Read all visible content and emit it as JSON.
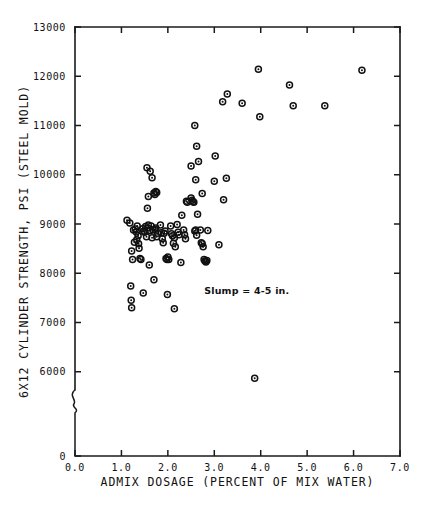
{
  "chart_data": {
    "type": "scatter",
    "title": "",
    "xlabel": "ADMIX DOSAGE (PERCENT OF MIX WATER)",
    "ylabel": "6X12 CYLINDER STRENGTH, PSI (STEEL MOLD)",
    "xlim": [
      0.0,
      7.0
    ],
    "ylim": [
      5500,
      13000
    ],
    "y_axis_break": true,
    "y_axis_break_note": "axis broken between 0 and 6000",
    "grid": false,
    "legend": "none",
    "xticks": [
      "0.0",
      "1.0",
      "2.0",
      "3.0",
      "4.0",
      "5.0",
      "6.0",
      "7.0"
    ],
    "xtick_values": [
      0.0,
      1.0,
      2.0,
      3.0,
      4.0,
      5.0,
      6.0,
      7.0
    ],
    "yticks": [
      "0",
      "6000",
      "7000",
      "8000",
      "9000",
      "10000",
      "11000",
      "12000",
      "13000"
    ],
    "ytick_values": [
      0,
      6000,
      7000,
      8000,
      9000,
      10000,
      11000,
      12000,
      13000
    ],
    "annotations": [
      {
        "name": "slump-annotation",
        "text": "Slump = 4-5 in.",
        "x": 3.7,
        "y": 7580
      }
    ],
    "marker_style": "open-circle-with-dot",
    "series": [
      {
        "name": "6x12 cylinder strength",
        "points": [
          [
            1.12,
            9075
          ],
          [
            1.18,
            9020
          ],
          [
            1.22,
            8450
          ],
          [
            1.24,
            8280
          ],
          [
            1.26,
            8880
          ],
          [
            1.28,
            8630
          ],
          [
            1.2,
            7740
          ],
          [
            1.21,
            7450
          ],
          [
            1.22,
            7300
          ],
          [
            1.34,
            8960
          ],
          [
            1.36,
            8760
          ],
          [
            1.37,
            8600
          ],
          [
            1.38,
            8510
          ],
          [
            1.4,
            8300
          ],
          [
            1.42,
            8280
          ],
          [
            1.3,
            8900
          ],
          [
            1.32,
            8840
          ],
          [
            1.33,
            8680
          ],
          [
            1.46,
            8905
          ],
          [
            1.48,
            8860
          ],
          [
            1.5,
            8830
          ],
          [
            1.52,
            8950
          ],
          [
            1.54,
            8740
          ],
          [
            1.56,
            8920
          ],
          [
            1.58,
            8980
          ],
          [
            1.47,
            7600
          ],
          [
            1.62,
            8870
          ],
          [
            1.64,
            8960
          ],
          [
            1.66,
            8720
          ],
          [
            1.68,
            8880
          ],
          [
            1.6,
            8170
          ],
          [
            1.72,
            8890
          ],
          [
            1.74,
            8920
          ],
          [
            1.76,
            8740
          ],
          [
            1.78,
            8810
          ],
          [
            1.7,
            7870
          ],
          [
            1.55,
            10140
          ],
          [
            1.62,
            10070
          ],
          [
            1.66,
            9940
          ],
          [
            1.58,
            9560
          ],
          [
            1.56,
            9320
          ],
          [
            1.7,
            9630
          ],
          [
            1.72,
            9600
          ],
          [
            1.74,
            9660
          ],
          [
            1.76,
            9640
          ],
          [
            1.84,
            8980
          ],
          [
            1.86,
            8820
          ],
          [
            1.88,
            8700
          ],
          [
            1.9,
            8620
          ],
          [
            1.92,
            8810
          ],
          [
            1.94,
            8860
          ],
          [
            1.96,
            8300
          ],
          [
            1.98,
            8280
          ],
          [
            2.0,
            8330
          ],
          [
            2.02,
            8280
          ],
          [
            1.99,
            7570
          ],
          [
            2.06,
            8960
          ],
          [
            2.08,
            8800
          ],
          [
            2.1,
            8760
          ],
          [
            2.12,
            8610
          ],
          [
            2.14,
            8720
          ],
          [
            2.16,
            8540
          ],
          [
            2.14,
            7280
          ],
          [
            2.2,
            8990
          ],
          [
            2.22,
            8830
          ],
          [
            2.24,
            8780
          ],
          [
            2.28,
            8220
          ],
          [
            2.34,
            8880
          ],
          [
            2.36,
            8780
          ],
          [
            2.38,
            8700
          ],
          [
            2.4,
            9460
          ],
          [
            2.42,
            9440
          ],
          [
            2.3,
            9180
          ],
          [
            2.5,
            9530
          ],
          [
            2.52,
            9480
          ],
          [
            2.54,
            9450
          ],
          [
            2.56,
            9440
          ],
          [
            2.58,
            8860
          ],
          [
            2.6,
            8880
          ],
          [
            2.62,
            8770
          ],
          [
            2.64,
            9200
          ],
          [
            2.7,
            8880
          ],
          [
            2.72,
            8620
          ],
          [
            2.74,
            8600
          ],
          [
            2.76,
            8540
          ],
          [
            2.78,
            8280
          ],
          [
            2.8,
            8250
          ],
          [
            2.82,
            8230
          ],
          [
            2.84,
            8260
          ],
          [
            2.86,
            8870
          ],
          [
            2.5,
            10180
          ],
          [
            2.58,
            11000
          ],
          [
            2.62,
            10580
          ],
          [
            2.66,
            10270
          ],
          [
            2.6,
            9900
          ],
          [
            2.74,
            9620
          ],
          [
            3.0,
            9870
          ],
          [
            3.02,
            10380
          ],
          [
            3.1,
            8580
          ],
          [
            3.2,
            9490
          ],
          [
            3.26,
            9930
          ],
          [
            3.18,
            11480
          ],
          [
            3.28,
            11640
          ],
          [
            3.6,
            11450
          ],
          [
            3.87,
            5870
          ],
          [
            3.95,
            12140
          ],
          [
            3.98,
            11180
          ],
          [
            4.62,
            11820
          ],
          [
            4.7,
            11400
          ],
          [
            5.38,
            11400
          ],
          [
            6.18,
            12120
          ]
        ]
      }
    ]
  },
  "axes_geometry": {
    "plot_left_px": 75,
    "plot_right_px": 400,
    "plot_top_px": 27,
    "plot_bottom_px": 456
  }
}
